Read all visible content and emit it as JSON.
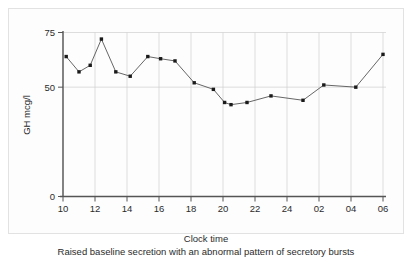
{
  "chart_data": {
    "type": "line",
    "title": "",
    "subtitle": "",
    "caption": "Raised baseline secretion with an abnormal pattern of secretory bursts",
    "xlabel": "Clock time",
    "ylabel": "GH mcg/l",
    "xtick_labels": [
      "10",
      "12",
      "14",
      "16",
      "18",
      "20",
      "22",
      "24",
      "02",
      "04",
      "06"
    ],
    "ytick_labels": [
      "0",
      "50",
      "75"
    ],
    "ytick_values": [
      0,
      50,
      75
    ],
    "ylim": [
      0,
      75
    ],
    "xlim": [
      10,
      30
    ],
    "grid": "vertical-gridlines-at-xticks-plus-horizontal-at-50-and-75",
    "legend": "none",
    "marker": "filled-square",
    "line_color": "#555555",
    "marker_color": "#1a1a1a",
    "grid_color": "#cfcfcf",
    "axis_color": "#555555",
    "x": [
      10.2,
      11.0,
      11.7,
      12.4,
      13.3,
      14.2,
      15.3,
      16.1,
      17.0,
      18.2,
      19.4,
      20.1,
      20.5,
      21.5,
      23.0,
      25.0,
      26.3,
      28.3,
      30.0
    ],
    "x_labels": [
      "10.2",
      "11.0",
      "11.7",
      "12.4",
      "13.3",
      "14.2",
      "15.3",
      "16.1",
      "17.0",
      "18.2",
      "19.4",
      "20.1",
      "20.5",
      "21.5",
      "23.0",
      "01.0",
      "02.3",
      "04.3",
      "06.0"
    ],
    "values": [
      64,
      57,
      60,
      72,
      57,
      55,
      64,
      63,
      62,
      52,
      49,
      43,
      42,
      43,
      46,
      44,
      51,
      50,
      65
    ]
  },
  "axis": {
    "y_top_label": "75",
    "y_mid_label": "50",
    "y_zero_label": "0"
  }
}
